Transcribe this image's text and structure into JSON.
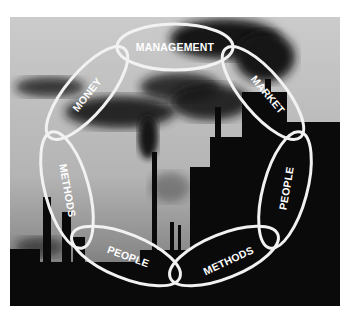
{
  "figure": {
    "background_colors": {
      "sky_top": "#c9c9c9",
      "sky_bottom": "#8a8a8a",
      "silhouette": "#0a0a0a",
      "smoke": "#1c1c1c",
      "ring_stroke": "#f2f2f2"
    },
    "ring": [
      {
        "label": "MANAGEMENT"
      },
      {
        "label": "MARKET"
      },
      {
        "label": "PEOPLE"
      },
      {
        "label": "METHODS"
      },
      {
        "label": "PEOPLE"
      },
      {
        "label": "METHODS"
      },
      {
        "label": "MONEY"
      }
    ]
  }
}
